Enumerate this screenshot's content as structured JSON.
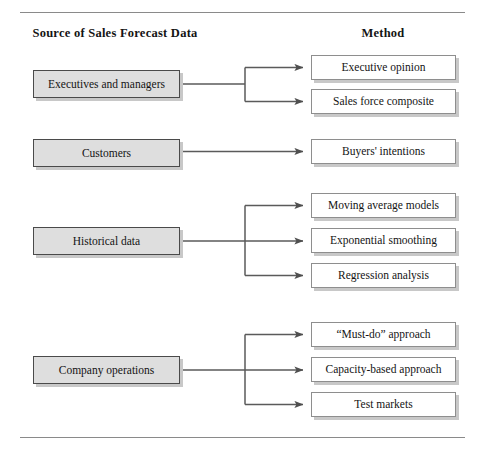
{
  "figure": {
    "headers": {
      "left": "Source of Sales Forecast Data",
      "right": "Method"
    },
    "rules": {
      "top_label": "top-divider",
      "bottom_label": "bottom-divider"
    }
  },
  "chart_data": {
    "type": "diagram",
    "title": "",
    "columns": [
      "Source of Sales Forecast Data",
      "Method"
    ],
    "groups": [
      {
        "source": "Executives and managers",
        "methods": [
          "Executive opinion",
          "Sales force composite"
        ]
      },
      {
        "source": "Customers",
        "methods": [
          "Buyers' intentions"
        ]
      },
      {
        "source": "Historical data",
        "methods": [
          "Moving average models",
          "Exponential smoothing",
          "Regression analysis"
        ]
      },
      {
        "source": "Company operations",
        "methods": [
          "“Must-do” approach",
          "Capacity-based approach",
          "Test markets"
        ]
      }
    ]
  },
  "sources": [
    {
      "label": "Executives and managers",
      "x": 33,
      "y": 70,
      "w": 147,
      "h": 28
    },
    {
      "label": "Customers",
      "x": 33,
      "y": 139,
      "w": 147,
      "h": 28
    },
    {
      "label": "Historical data",
      "x": 33,
      "y": 227,
      "w": 147,
      "h": 28
    },
    {
      "label": "Company operations",
      "x": 33,
      "y": 356,
      "w": 147,
      "h": 28
    }
  ],
  "methods": [
    {
      "label": "Executive opinion",
      "x": 311,
      "y": 55,
      "w": 145,
      "h": 25
    },
    {
      "label": "Sales force composite",
      "x": 311,
      "y": 89,
      "w": 145,
      "h": 25
    },
    {
      "label": "Buyers' intentions",
      "x": 311,
      "y": 139,
      "w": 145,
      "h": 25
    },
    {
      "label": "Moving average models",
      "x": 311,
      "y": 193,
      "w": 145,
      "h": 25
    },
    {
      "label": "Exponential smoothing",
      "x": 311,
      "y": 228,
      "w": 145,
      "h": 25
    },
    {
      "label": "Regression analysis",
      "x": 311,
      "y": 263,
      "w": 145,
      "h": 25
    },
    {
      "label": "“Must-do” approach",
      "x": 311,
      "y": 322,
      "w": 145,
      "h": 25
    },
    {
      "label": "Capacity-based approach",
      "x": 311,
      "y": 357,
      "w": 145,
      "h": 25
    },
    {
      "label": "Test markets",
      "x": 311,
      "y": 392,
      "w": 145,
      "h": 25
    }
  ],
  "colors": {
    "source_fill": "#dedede",
    "method_fill": "#ffffff",
    "border_dark": "#4a4a4a",
    "border_light": "#8e8e8e",
    "shadow": "#c8c8c8",
    "rule": "#8a8a8a",
    "wire": "#5a5a5a",
    "text": "#141414"
  },
  "layout": {
    "rule_left": 20,
    "rule_right": 465,
    "rule_top_y": 12,
    "rule_bottom_y": 437,
    "header_left_center": 115,
    "header_right_center": 383,
    "header_y": 26
  }
}
